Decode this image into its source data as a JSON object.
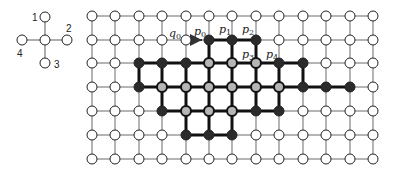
{
  "legend": {
    "center": [
      45,
      40
    ],
    "neighbors": [
      {
        "id": "1",
        "pos": [
          45,
          17
        ],
        "label_pos": [
          32,
          21
        ]
      },
      {
        "id": "2",
        "pos": [
          67,
          40
        ],
        "label_pos": [
          66,
          32
        ]
      },
      {
        "id": "3",
        "pos": [
          45,
          63
        ],
        "label_pos": [
          54,
          68
        ]
      },
      {
        "id": "4",
        "pos": [
          22,
          40
        ],
        "label_pos": [
          17,
          57
        ]
      }
    ]
  },
  "grid": {
    "cols_x": [
      92,
      115,
      139,
      162,
      186,
      209,
      232,
      256,
      279,
      303,
      326,
      350,
      373
    ],
    "rows_y": [
      16,
      40,
      63,
      87,
      111,
      135,
      159
    ],
    "node_radius": 5,
    "colors": {
      "W": "#ffffff",
      "B": "#2b2b2b",
      "G": "#b5b5b5",
      "thin_edge": "#777777",
      "thick_edge": "#111111",
      "outline": "#222222"
    },
    "states": [
      "WWWWWWWWWWWWW",
      "WWWWWBBBWWWWW",
      "WWBBBGGGBBWWW",
      "WWBGGGGGGBBBW",
      "WWWBGGGBBWWWW",
      "WWWWBBBWWWWWW",
      "WWWWWWWWWWWWW"
    ]
  },
  "arrow": {
    "from": [
      4,
      1
    ],
    "to": [
      5,
      1
    ],
    "color": "#333333"
  },
  "labels": [
    {
      "base": "q",
      "sub": "0",
      "pos": [
        169,
        37
      ]
    },
    {
      "base": "p",
      "sub": "0",
      "pos": [
        194,
        35
      ]
    },
    {
      "base": "p",
      "sub": "1",
      "pos": [
        219,
        33
      ]
    },
    {
      "base": "p",
      "sub": "2",
      "pos": [
        242,
        33
      ]
    },
    {
      "base": "p",
      "sub": "3",
      "pos": [
        242,
        58
      ]
    },
    {
      "base": "p",
      "sub": "4",
      "pos": [
        266,
        58
      ]
    }
  ]
}
